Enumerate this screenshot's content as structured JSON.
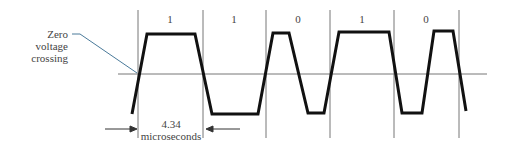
{
  "annotation": {
    "line1": "Zero voltage",
    "line2": "crossing"
  },
  "duration": {
    "value": "4.34",
    "unit": "microseconds"
  },
  "bits": [
    {
      "label": "1",
      "x": 170
    },
    {
      "label": "1",
      "x": 234
    },
    {
      "label": "0",
      "x": 298
    },
    {
      "label": "1",
      "x": 362
    },
    {
      "label": "0",
      "x": 426
    }
  ],
  "colors": {
    "waveform": "#111111",
    "grid": "#777777",
    "leader": "#4a7a9a"
  }
}
